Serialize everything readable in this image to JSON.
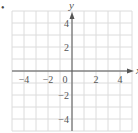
{
  "marker": "•",
  "chart_data": {
    "type": "scatter",
    "title": "",
    "xlabel": "x",
    "ylabel": "y",
    "xlim": [
      -5,
      5
    ],
    "ylim": [
      -5,
      5
    ],
    "grid": true,
    "grid_step": 1,
    "x_ticks": [
      -4,
      -2,
      0,
      2,
      4
    ],
    "x_tick_labels": [
      "−4",
      "−2",
      "0",
      "2",
      "4"
    ],
    "y_ticks": [
      4,
      2,
      -2,
      -4
    ],
    "y_tick_labels": [
      "4",
      "2",
      "−2",
      "−4"
    ],
    "series": [],
    "colors": {
      "grid": "#dcdcdc",
      "axis": "#555555",
      "text": "#555555"
    }
  }
}
